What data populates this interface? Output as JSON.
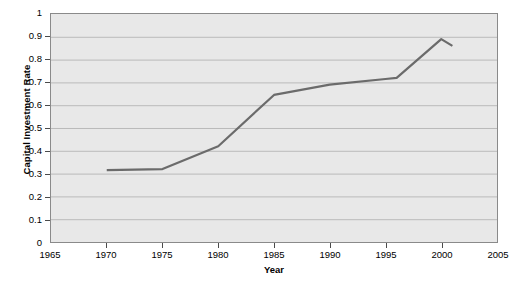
{
  "chart_data": {
    "type": "line",
    "title": "",
    "xlabel": "Year",
    "ylabel": "Capital Investment Rate",
    "xlim": [
      1965,
      2005
    ],
    "ylim": [
      0,
      1
    ],
    "xticks": [
      "1965",
      "1970",
      "1975",
      "1980",
      "1985",
      "1990",
      "1995",
      "2000",
      "2005"
    ],
    "yticks": [
      "0",
      "0.1",
      "0.2",
      "0.3",
      "0.4",
      "0.5",
      "0.6",
      "0.7",
      "0.8",
      "0.9",
      "1"
    ],
    "grid": "horizontal",
    "legend": "none",
    "plot_background": "#e8e8e8",
    "line_color": "#6b6b6b",
    "series": [
      {
        "name": "Capital Investment Rate",
        "x": [
          1970,
          1975,
          1980,
          1985,
          1990,
          1995,
          1996,
          2000,
          2001
        ],
        "values": [
          0.315,
          0.32,
          0.42,
          0.645,
          0.69,
          0.715,
          0.72,
          0.89,
          0.86
        ]
      }
    ]
  }
}
